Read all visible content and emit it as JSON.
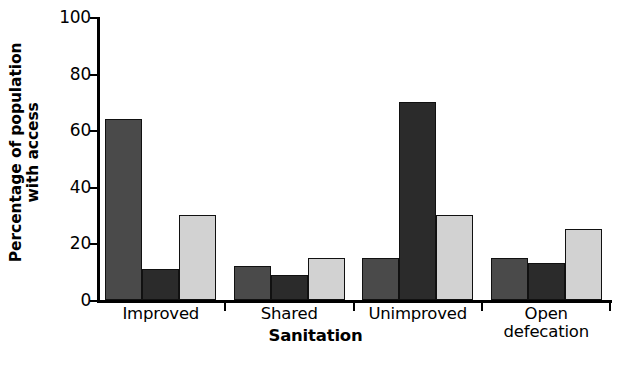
{
  "chart_data": {
    "type": "bar",
    "title": "",
    "subtitle": "",
    "xlabel": "Sanitation",
    "ylabel_line1": "Percentage of population",
    "ylabel_line2": "with access",
    "categories": [
      "Improved",
      "Shared",
      "Unimproved",
      "Open defecation"
    ],
    "category_lines": [
      [
        "Improved"
      ],
      [
        "Shared"
      ],
      [
        "Unimproved"
      ],
      [
        "Open",
        "defecation"
      ]
    ],
    "ylim": [
      0,
      100
    ],
    "yticks": [
      0,
      20,
      40,
      60,
      80,
      100
    ],
    "ytick_labels": [
      "0",
      "20",
      "40",
      "60",
      "80",
      "100"
    ],
    "grid": false,
    "legend": "none",
    "series": [
      {
        "name": "series-1",
        "color": "#4a4a4a",
        "values": [
          64,
          12,
          15,
          15
        ]
      },
      {
        "name": "series-2",
        "color": "#2b2b2b",
        "values": [
          11,
          9,
          70,
          13
        ]
      },
      {
        "name": "series-3",
        "color": "#d2d2d2",
        "values": [
          30,
          15,
          30,
          25
        ]
      }
    ],
    "colors": {
      "series_1": "#4a4a4a",
      "series_2": "#2b2b2b",
      "series_3": "#d2d2d2",
      "axis": "#000000",
      "background": "#ffffff"
    }
  }
}
